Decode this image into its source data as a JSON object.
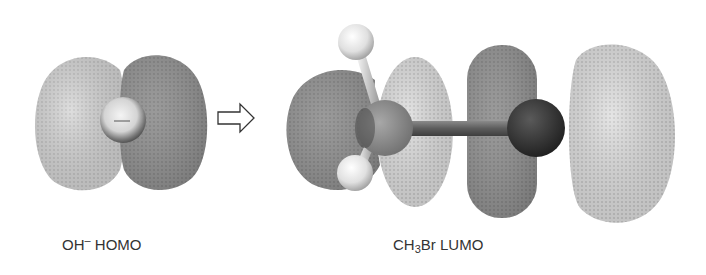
{
  "figure": {
    "left_panel": {
      "label_main": "OH",
      "label_charge": "–",
      "label_orbital": " HOMO",
      "sphere_sign": "–"
    },
    "arrow": {
      "icon": "hollow-right-arrow-icon"
    },
    "right_panel": {
      "label_ch": "CH",
      "label_sub": "3",
      "label_br": "Br",
      "label_orbital": " LUMO"
    },
    "colors": {
      "light_lobe": "#cfcfcf",
      "dark_lobe": "#8c8c8c",
      "bromine_atom": "#2e2e2e",
      "carbon_atom": "#8a8a8a",
      "hydrogen_atom": "#e6e6e6",
      "bond": "#6a6a6a",
      "text": "#333333"
    }
  }
}
